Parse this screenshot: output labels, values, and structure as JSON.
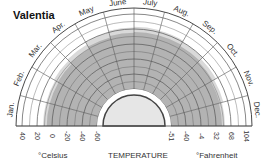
{
  "chart_data": {
    "type": "radial-climate",
    "title": "Valentia",
    "months": [
      "Jan.",
      "Feb.",
      "Mar.",
      "Apr.",
      "May",
      "June",
      "July",
      "Aug.",
      "Sep.",
      "Oct.",
      "Nov.",
      "Dec."
    ],
    "xlabel": "TEMPERATURE",
    "celsius_label": "°Celsius",
    "fahrenheit_label": "°Fahrenheit",
    "celsius_ticks": [
      "40",
      "20",
      "0",
      "-20",
      "-40",
      "-60"
    ],
    "fahrenheit_ticks": [
      "-51",
      "-40",
      "-4",
      "32",
      "68",
      "104"
    ],
    "scale_c": {
      "min": -60,
      "max": 40,
      "step": 20
    },
    "grid": true,
    "series": [
      {
        "name": "extreme range",
        "lows": [
          -60,
          -60,
          -60,
          -60,
          -60,
          -60,
          -60,
          -60,
          -60,
          -60,
          -60,
          -60
        ],
        "highs": [
          12,
          12,
          14,
          16,
          20,
          22,
          23,
          22,
          20,
          17,
          14,
          12
        ]
      },
      {
        "name": "mean range",
        "lows": [
          -60,
          -60,
          -60,
          -60,
          -60,
          -60,
          -60,
          -60,
          -60,
          -60,
          -60,
          -60
        ],
        "highs": [
          7,
          7,
          8,
          10,
          13,
          15,
          16,
          16,
          14,
          12,
          9,
          8
        ]
      }
    ],
    "colors": {
      "light_band": "#d9d9d9",
      "dark_band": "#b3b3b3",
      "grid": "#555555",
      "center": "#e6e6e6"
    }
  }
}
